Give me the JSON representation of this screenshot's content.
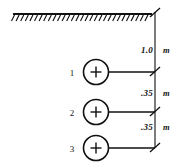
{
  "diagram": {
    "type": "engineering-cross-section",
    "ground": {
      "label": "ground-surface",
      "hatch_count": 30
    },
    "conductors": [
      {
        "label": "1",
        "symbol": "+",
        "depth_dimension": "1.0",
        "unit": "m"
      },
      {
        "label": "2",
        "symbol": "+",
        "depth_dimension": ".35",
        "unit": "m"
      },
      {
        "label": "3",
        "symbol": "+",
        "depth_dimension": ".35",
        "unit": "m"
      }
    ],
    "dimensions": [
      {
        "value": "1.0",
        "unit": "m",
        "from": "ground-surface",
        "to": "conductor-1"
      },
      {
        "value": ".35",
        "unit": "m",
        "from": "conductor-1",
        "to": "conductor-2"
      },
      {
        "value": ".35",
        "unit": "m",
        "from": "conductor-2",
        "to": "conductor-3"
      }
    ],
    "colors": {
      "line": "#111111",
      "background": "#ffffff"
    }
  }
}
